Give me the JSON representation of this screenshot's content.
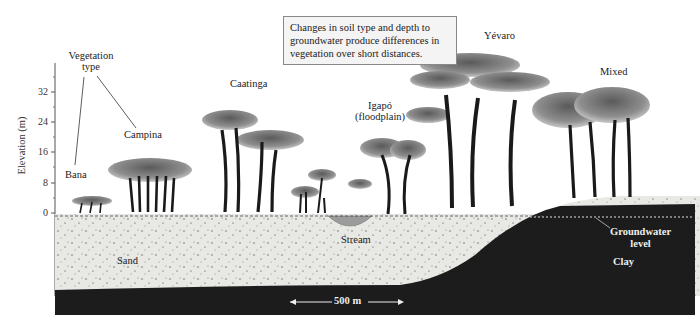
{
  "caption": "Changes in soil type and depth to groundwater produce differences in vegetation over short distances.",
  "axis": {
    "label": "Elevation (m)",
    "ticks": [
      "32",
      "24",
      "16",
      "8",
      "0"
    ],
    "unit": "m"
  },
  "legend": {
    "title_line1": "Vegetation",
    "title_line2": "type"
  },
  "vegetation_types": [
    {
      "name": "Bana"
    },
    {
      "name": "Campina"
    },
    {
      "name": "Caatinga"
    },
    {
      "name": "Igapó",
      "note": "(floodplain)"
    },
    {
      "name": "Yévaro"
    },
    {
      "name": "Mixed"
    }
  ],
  "soil": {
    "sand": "Sand",
    "clay": "Clay",
    "stream": "Stream",
    "groundwater_line1": "Groundwater",
    "groundwater_line2": "level"
  },
  "scale_bar": "500 m",
  "colors": {
    "sand": "#e9e9e6",
    "clay": "#1c1c1c",
    "canopy": "#8a8a8a",
    "trunk": "#1a1a1a",
    "stream": "#9c9c9c"
  }
}
